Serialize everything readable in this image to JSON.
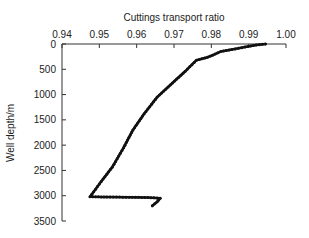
{
  "chart_data": {
    "type": "line",
    "title": "",
    "xlabel": "Cuttings transport ratio",
    "ylabel": "Well depth/m",
    "x_axis_position": "top",
    "y_axis_inverted": true,
    "xlim": [
      0.94,
      1.0
    ],
    "ylim": [
      0,
      3500
    ],
    "xticks": [
      "0.94",
      "0.95",
      "0.96",
      "0.97",
      "0.98",
      "0.99",
      "1.00"
    ],
    "yticks": [
      "0",
      "500",
      "1000",
      "1500",
      "2000",
      "2500",
      "3000",
      "3500"
    ],
    "grid": false,
    "legend": "none",
    "series": [
      {
        "name": "Cuttings transport ratio",
        "marker": "dot",
        "color": "#111111",
        "x": [
          0.9945,
          0.992,
          0.989,
          0.9855,
          0.9825,
          0.981,
          0.979,
          0.976,
          0.973,
          0.969,
          0.9655,
          0.962,
          0.959,
          0.9565,
          0.9535,
          0.9505,
          0.9475,
          0.952,
          0.958,
          0.963,
          0.9663,
          0.9655,
          0.9642
        ],
        "y": [
          0,
          20,
          60,
          110,
          150,
          200,
          260,
          320,
          540,
          810,
          1050,
          1380,
          1700,
          2050,
          2430,
          2720,
          3020,
          3025,
          3030,
          3035,
          3050,
          3120,
          3200
        ]
      }
    ]
  }
}
